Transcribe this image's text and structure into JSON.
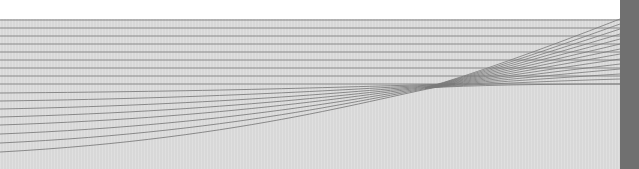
{
  "canvas": {
    "width": 639,
    "height": 169,
    "colors": {
      "background_top": "#ffffff",
      "panel": "#dcdcdc",
      "side_bar": "#707070",
      "line": "#7a7a7a"
    }
  },
  "graphic": {
    "description": "Abstract line pattern: horizontal lines on a light gray panel; lower lines curve up and converge to a point, then fan out to the right edge",
    "left_edge_line_y": [
      20,
      28,
      36,
      44,
      52,
      60,
      68,
      76,
      84,
      93,
      101,
      109,
      117,
      125,
      134,
      143,
      152
    ],
    "convergence_point": {
      "x": 455,
      "y": 84
    },
    "right_edge_x": 620,
    "fan_right_edge_y": [
      19,
      24,
      29,
      34,
      39,
      44,
      49,
      54,
      59,
      64,
      69,
      74,
      79,
      84
    ]
  }
}
